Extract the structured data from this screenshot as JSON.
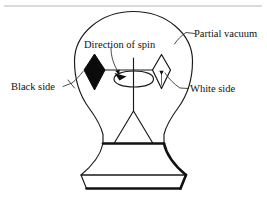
{
  "figure": {
    "background_color": "#ffffff",
    "ink_color": "#111111"
  },
  "labels": {
    "partial_vacuum": "Partial vacuum",
    "direction_of_spin": "Direction of spin",
    "black_side": "Black side",
    "white_side": "White side"
  },
  "parts": {
    "bulb": "glass-bulb",
    "black_vane": "black-vane-diamond",
    "white_vane": "white-vane-diamond",
    "spindle": "vertical-spindle",
    "vane_arm": "horizontal-vane-arm",
    "spin_ellipse": "rotation-indicator-ellipse",
    "base": "pedestal-base"
  },
  "colors": {
    "black_vane_fill": "#0b0b0b",
    "white_vane_fill": "#ffffff",
    "outline": "#1a1a1a"
  }
}
